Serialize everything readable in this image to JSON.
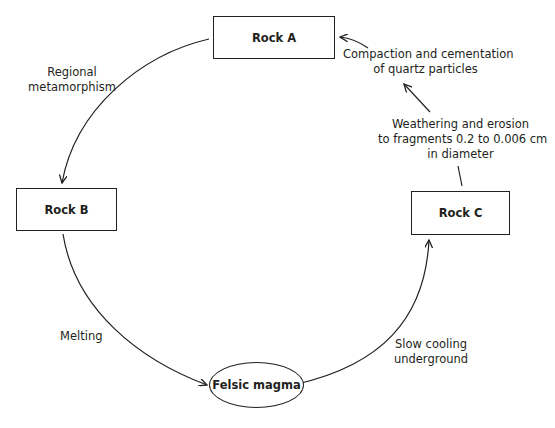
{
  "diagram": {
    "colors": {
      "stroke": "#231f20",
      "background": "#ffffff",
      "text": "#231f20"
    },
    "nodes": [
      {
        "id": "rock_a",
        "label": "Rock A",
        "shape": "rectangle"
      },
      {
        "id": "rock_b",
        "label": "Rock B",
        "shape": "rectangle"
      },
      {
        "id": "rock_c",
        "label": "Rock C",
        "shape": "rectangle"
      },
      {
        "id": "felsic_magma",
        "label": "Felsic magma",
        "shape": "ellipse"
      }
    ],
    "edges": [
      {
        "from": "rock_a",
        "to": "rock_b",
        "label_lines": [
          "Regional",
          "metamorphism"
        ]
      },
      {
        "from": "rock_b",
        "to": "felsic_magma",
        "label_lines": [
          "Melting"
        ]
      },
      {
        "from": "felsic_magma",
        "to": "rock_c",
        "label_lines": [
          "Slow cooling",
          "underground"
        ]
      },
      {
        "from": "rock_c",
        "to": "compaction_step",
        "label_lines": [
          "Weathering and erosion",
          "to fragments 0.2 to 0.006 cm",
          "in diameter"
        ]
      },
      {
        "from": "compaction_step",
        "to": "rock_a",
        "label_lines": [
          "Compaction and cementation",
          "of quartz particles"
        ]
      }
    ]
  }
}
